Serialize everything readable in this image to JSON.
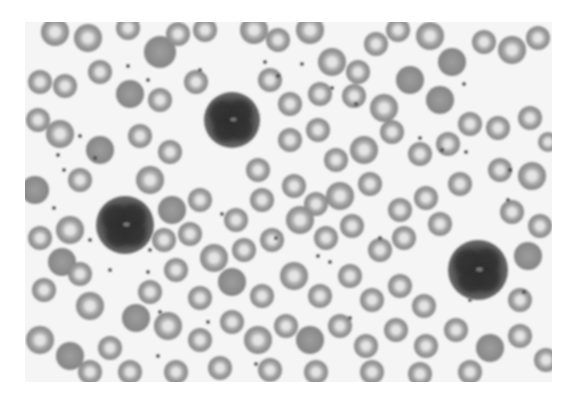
{
  "image": {
    "subject": "Peripheral blood smear micrograph (grayscale)",
    "description": "Numerous red blood cells with central pallor and three darkly stained white blood cells (leukocytes) with lobulated/granular nuclei, scattered platelets on a pale background",
    "frame": {
      "x": 25,
      "y": 22,
      "width": 527,
      "height": 360
    },
    "colors": {
      "background": "#ffffff",
      "field": "#f5f5f5",
      "rbc_rim": "#8c8c8c",
      "rbc_center": "#d8d8d8",
      "rbc_dense": "#909090",
      "wbc_outer": "#5a5a5a",
      "wbc_nucleus": "#2e2e2e",
      "platelet": "#3a3a3a"
    }
  },
  "leukocytes": [
    {
      "cx": 232,
      "cy": 120,
      "r": 28
    },
    {
      "cx": 125,
      "cy": 225,
      "r": 29
    },
    {
      "cx": 478,
      "cy": 270,
      "r": 30
    }
  ],
  "erythrocytes": [
    [
      55,
      32,
      14,
      1
    ],
    [
      88,
      38,
      14,
      1
    ],
    [
      128,
      28,
      12,
      1
    ],
    [
      160,
      52,
      16,
      0
    ],
    [
      178,
      34,
      12,
      1
    ],
    [
      205,
      30,
      12,
      1
    ],
    [
      254,
      30,
      14,
      1
    ],
    [
      278,
      40,
      12,
      1
    ],
    [
      310,
      30,
      14,
      1
    ],
    [
      332,
      62,
      14,
      1
    ],
    [
      358,
      72,
      12,
      1
    ],
    [
      376,
      44,
      12,
      1
    ],
    [
      398,
      30,
      12,
      1
    ],
    [
      430,
      36,
      14,
      1
    ],
    [
      452,
      62,
      14,
      0
    ],
    [
      484,
      42,
      12,
      1
    ],
    [
      512,
      50,
      14,
      1
    ],
    [
      538,
      38,
      12,
      1
    ],
    [
      40,
      82,
      12,
      1
    ],
    [
      65,
      86,
      12,
      1
    ],
    [
      100,
      72,
      12,
      1
    ],
    [
      130,
      94,
      14,
      0
    ],
    [
      160,
      100,
      12,
      1
    ],
    [
      196,
      82,
      12,
      1
    ],
    [
      270,
      80,
      12,
      1
    ],
    [
      290,
      104,
      12,
      1
    ],
    [
      320,
      94,
      12,
      1
    ],
    [
      354,
      96,
      12,
      1
    ],
    [
      384,
      108,
      14,
      1
    ],
    [
      410,
      80,
      14,
      0
    ],
    [
      440,
      100,
      14,
      0
    ],
    [
      470,
      124,
      12,
      1
    ],
    [
      498,
      128,
      12,
      1
    ],
    [
      530,
      118,
      12,
      1
    ],
    [
      548,
      142,
      10,
      1
    ],
    [
      38,
      120,
      12,
      1
    ],
    [
      60,
      134,
      14,
      1
    ],
    [
      100,
      150,
      14,
      0
    ],
    [
      140,
      136,
      12,
      1
    ],
    [
      170,
      152,
      12,
      1
    ],
    [
      258,
      170,
      12,
      1
    ],
    [
      290,
      140,
      12,
      1
    ],
    [
      318,
      130,
      12,
      1
    ],
    [
      336,
      160,
      12,
      1
    ],
    [
      364,
      150,
      14,
      1
    ],
    [
      392,
      132,
      12,
      1
    ],
    [
      420,
      154,
      12,
      1
    ],
    [
      448,
      144,
      12,
      1
    ],
    [
      500,
      170,
      12,
      1
    ],
    [
      532,
      176,
      14,
      1
    ],
    [
      35,
      190,
      14,
      0
    ],
    [
      80,
      180,
      12,
      1
    ],
    [
      150,
      180,
      14,
      1
    ],
    [
      172,
      210,
      14,
      0
    ],
    [
      200,
      200,
      12,
      1
    ],
    [
      236,
      220,
      12,
      1
    ],
    [
      262,
      200,
      12,
      1
    ],
    [
      294,
      186,
      12,
      1
    ],
    [
      316,
      204,
      12,
      1
    ],
    [
      340,
      196,
      14,
      1
    ],
    [
      370,
      184,
      12,
      1
    ],
    [
      400,
      210,
      12,
      1
    ],
    [
      426,
      198,
      12,
      1
    ],
    [
      460,
      184,
      12,
      1
    ],
    [
      512,
      212,
      12,
      1
    ],
    [
      540,
      226,
      12,
      1
    ],
    [
      40,
      238,
      12,
      1
    ],
    [
      70,
      230,
      14,
      1
    ],
    [
      62,
      262,
      14,
      0
    ],
    [
      164,
      240,
      12,
      1
    ],
    [
      190,
      234,
      12,
      1
    ],
    [
      214,
      258,
      14,
      1
    ],
    [
      244,
      250,
      12,
      1
    ],
    [
      272,
      240,
      12,
      1
    ],
    [
      300,
      220,
      14,
      1
    ],
    [
      326,
      238,
      12,
      1
    ],
    [
      352,
      226,
      12,
      1
    ],
    [
      380,
      250,
      12,
      1
    ],
    [
      404,
      238,
      12,
      1
    ],
    [
      440,
      224,
      12,
      1
    ],
    [
      528,
      256,
      14,
      0
    ],
    [
      44,
      290,
      12,
      1
    ],
    [
      80,
      274,
      12,
      1
    ],
    [
      90,
      306,
      14,
      1
    ],
    [
      150,
      292,
      12,
      1
    ],
    [
      176,
      270,
      12,
      1
    ],
    [
      200,
      298,
      12,
      1
    ],
    [
      232,
      282,
      14,
      0
    ],
    [
      262,
      296,
      12,
      1
    ],
    [
      294,
      276,
      14,
      1
    ],
    [
      320,
      296,
      12,
      1
    ],
    [
      350,
      276,
      12,
      1
    ],
    [
      372,
      300,
      12,
      1
    ],
    [
      400,
      286,
      12,
      1
    ],
    [
      424,
      306,
      12,
      1
    ],
    [
      520,
      300,
      12,
      1
    ],
    [
      40,
      340,
      14,
      1
    ],
    [
      70,
      356,
      14,
      0
    ],
    [
      110,
      348,
      12,
      1
    ],
    [
      136,
      318,
      14,
      0
    ],
    [
      168,
      326,
      14,
      1
    ],
    [
      200,
      340,
      12,
      1
    ],
    [
      232,
      322,
      12,
      1
    ],
    [
      258,
      340,
      14,
      1
    ],
    [
      286,
      326,
      12,
      1
    ],
    [
      310,
      340,
      14,
      0
    ],
    [
      340,
      326,
      12,
      1
    ],
    [
      366,
      346,
      12,
      1
    ],
    [
      396,
      330,
      12,
      1
    ],
    [
      426,
      346,
      12,
      1
    ],
    [
      456,
      330,
      12,
      1
    ],
    [
      490,
      348,
      14,
      0
    ],
    [
      520,
      336,
      12,
      1
    ],
    [
      546,
      360,
      12,
      1
    ],
    [
      90,
      372,
      12,
      1
    ],
    [
      130,
      372,
      12,
      1
    ],
    [
      176,
      372,
      12,
      1
    ],
    [
      220,
      368,
      12,
      1
    ],
    [
      270,
      370,
      12,
      1
    ],
    [
      316,
      372,
      12,
      1
    ],
    [
      372,
      372,
      12,
      1
    ],
    [
      420,
      374,
      12,
      1
    ],
    [
      470,
      372,
      12,
      1
    ]
  ],
  "platelets": [
    [
      128,
      66
    ],
    [
      148,
      80
    ],
    [
      200,
      70
    ],
    [
      265,
      62
    ],
    [
      278,
      76
    ],
    [
      302,
      64
    ],
    [
      332,
      88
    ],
    [
      356,
      104
    ],
    [
      464,
      84
    ],
    [
      420,
      138
    ],
    [
      442,
      150
    ],
    [
      466,
      152
    ],
    [
      510,
      170
    ],
    [
      80,
      136
    ],
    [
      95,
      158
    ],
    [
      58,
      155
    ],
    [
      64,
      170
    ],
    [
      54,
      208
    ],
    [
      90,
      240
    ],
    [
      150,
      250
    ],
    [
      148,
      272
    ],
    [
      110,
      270
    ],
    [
      276,
      238
    ],
    [
      318,
      256
    ],
    [
      330,
      262
    ],
    [
      160,
      312
    ],
    [
      158,
      356
    ],
    [
      208,
      322
    ],
    [
      256,
      364
    ],
    [
      470,
      300
    ],
    [
      524,
      292
    ],
    [
      508,
      200
    ],
    [
      350,
      318
    ],
    [
      380,
      238
    ],
    [
      222,
      214
    ]
  ],
  "caption": {
    "text": ""
  }
}
